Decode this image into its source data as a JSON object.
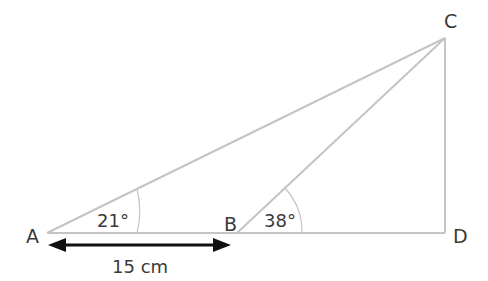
{
  "diagram": {
    "type": "geometry-triangle",
    "points": {
      "A": {
        "label": "A",
        "x": 47,
        "y": 233
      },
      "B": {
        "label": "B",
        "x": 237,
        "y": 233
      },
      "C": {
        "label": "C",
        "x": 445,
        "y": 38
      },
      "D": {
        "label": "D",
        "x": 445,
        "y": 233
      }
    },
    "angles": {
      "A": {
        "label": "21°",
        "value": 21
      },
      "B": {
        "label": "38°",
        "value": 38
      }
    },
    "measurement": {
      "label": "15 cm",
      "from": "A",
      "to": "B"
    },
    "colors": {
      "line": "#c4c4c4",
      "arrow": "#111111",
      "text": "#3a3a3a"
    }
  }
}
